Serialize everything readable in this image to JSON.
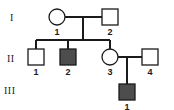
{
  "figure": {
    "type": "pedigree-chart",
    "background": "#ffffff",
    "stroke_color": "#1a1a1a",
    "affected_fill": "#4d4d4d",
    "unaffected_fill": "#ffffff",
    "width": 174,
    "height": 110
  },
  "generations": [
    {
      "label": "I",
      "x": 10,
      "y": 13
    },
    {
      "label": "II",
      "x": 7,
      "y": 54
    },
    {
      "label": "III",
      "x": 4,
      "y": 86
    }
  ],
  "individuals": [
    {
      "id": "I-1",
      "label": "1",
      "shape": "circle",
      "sex": "female",
      "affected": false,
      "cx": 57,
      "cy": 17,
      "size": 16,
      "label_x": 57,
      "label_y": 28
    },
    {
      "id": "I-2",
      "label": "2",
      "shape": "square",
      "sex": "male",
      "affected": false,
      "cx": 110,
      "cy": 17,
      "size": 16,
      "label_x": 110,
      "label_y": 28
    },
    {
      "id": "II-1",
      "label": "1",
      "shape": "square",
      "sex": "male",
      "affected": false,
      "cx": 36,
      "cy": 57,
      "size": 16,
      "label_x": 36,
      "label_y": 68
    },
    {
      "id": "II-2",
      "label": "2",
      "shape": "square",
      "sex": "male",
      "affected": true,
      "cx": 68,
      "cy": 57,
      "size": 16,
      "label_x": 68,
      "label_y": 68
    },
    {
      "id": "II-3",
      "label": "3",
      "shape": "circle",
      "sex": "female",
      "affected": false,
      "cx": 110,
      "cy": 57,
      "size": 16,
      "label_x": 110,
      "label_y": 68
    },
    {
      "id": "II-4",
      "label": "4",
      "shape": "square",
      "sex": "male",
      "affected": false,
      "cx": 150,
      "cy": 57,
      "size": 16,
      "label_x": 150,
      "label_y": 68
    },
    {
      "id": "III-1",
      "label": "1",
      "shape": "square",
      "sex": "male",
      "affected": true,
      "cx": 127,
      "cy": 92,
      "size": 16,
      "label_x": 127,
      "label_y": 103
    }
  ],
  "connections": {
    "mating_lines": [
      {
        "id": "mating-I1-I2",
        "x1": 65,
        "y1": 17,
        "x2": 102,
        "y2": 17
      },
      {
        "id": "mating-II3-II4",
        "x1": 118,
        "y1": 57,
        "x2": 142,
        "y2": 57
      }
    ],
    "descent_lines": [
      {
        "id": "descent-genI",
        "x1": 83,
        "y1": 17,
        "x2": 83,
        "y2": 40
      },
      {
        "id": "descent-genII",
        "x1": 127,
        "y1": 57,
        "x2": 127,
        "y2": 84
      }
    ],
    "sibship_lines": [
      {
        "id": "sibship-genII",
        "x1": 36,
        "y1": 40,
        "x2": 110,
        "y2": 40
      }
    ],
    "drop_lines": [
      {
        "id": "drop-II1",
        "x1": 36,
        "y1": 40,
        "x2": 36,
        "y2": 49
      },
      {
        "id": "drop-II2",
        "x1": 68,
        "y1": 40,
        "x2": 68,
        "y2": 49
      },
      {
        "id": "drop-II3",
        "x1": 110,
        "y1": 40,
        "x2": 110,
        "y2": 49
      }
    ]
  }
}
